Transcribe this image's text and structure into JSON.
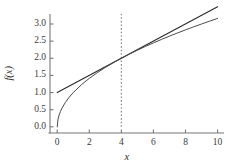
{
  "chart_data": {
    "type": "line",
    "title": "",
    "xlabel": "x",
    "ylabel": "f(x)",
    "xlim": [
      -0.45,
      10.4
    ],
    "ylim": [
      -0.18,
      3.35
    ],
    "grid": false,
    "legend": "none",
    "xticks": [
      "0",
      "2",
      "4",
      "6",
      "8",
      "10"
    ],
    "xtick_values": [
      0,
      2,
      4,
      6,
      8,
      10
    ],
    "yticks": [
      "0.0",
      "0.5",
      "1.0",
      "1.5",
      "2.0",
      "2.5",
      "3.0"
    ],
    "ytick_values": [
      0.0,
      0.5,
      1.0,
      1.5,
      2.0,
      2.5,
      3.0
    ],
    "series": [
      {
        "name": "f(x) = sqrt(x)",
        "kind": "curve",
        "color": "#4a4a4a",
        "linewidth": 1.0,
        "x": [
          0,
          0.05,
          0.1,
          0.2,
          0.3,
          0.5,
          0.75,
          1,
          1.5,
          2,
          2.5,
          3,
          3.5,
          4,
          4.5,
          5,
          5.5,
          6,
          6.5,
          7,
          7.5,
          8,
          8.5,
          9,
          9.5,
          10
        ],
        "values": [
          0,
          0.2236,
          0.3162,
          0.4472,
          0.5477,
          0.7071,
          0.866,
          1,
          1.2247,
          1.4142,
          1.5811,
          1.7321,
          1.8708,
          2,
          2.1213,
          2.2361,
          2.3452,
          2.4495,
          2.5495,
          2.6458,
          2.7386,
          2.8284,
          2.9155,
          3,
          3.0822,
          3.1623
        ]
      },
      {
        "name": "tangent at x = 4: y = 1 + x/4",
        "kind": "line",
        "color": "#2a2a2a",
        "linewidth": 1.1,
        "x": [
          0,
          10
        ],
        "values": [
          1.0,
          3.5
        ]
      }
    ],
    "annotations": [
      {
        "name": "vertical-dashed-line",
        "kind": "vline",
        "x": 4,
        "y_from": 0,
        "y_to": 3.35,
        "style": "dotted",
        "color": "#8a8a8a"
      },
      {
        "name": "tangent-point",
        "x": 4,
        "y": 2.0
      }
    ],
    "spines": {
      "left": true,
      "bottom": true,
      "top": false,
      "right": false,
      "color": "#777777"
    }
  }
}
